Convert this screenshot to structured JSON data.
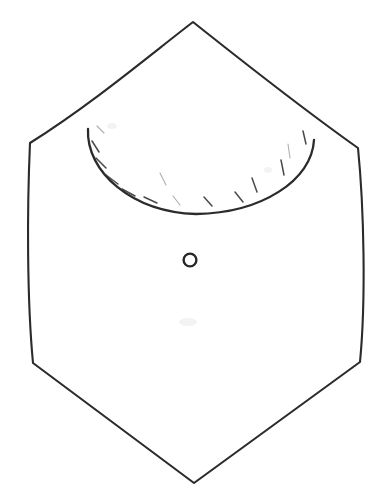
{
  "document": {
    "title": "Hand-drawn sewing pattern piece",
    "subject": "garment yoke / bib panel",
    "medium": "ink line drawing on white paper",
    "width_px": 378,
    "height_px": 502
  },
  "colors": {
    "background": "#ffffff",
    "ink": "#2b2b2b",
    "ink_light": "#6a6a6a",
    "mark": "#262626"
  },
  "shapes": {
    "outline": {
      "name": "hexagonal-panel-outline",
      "description": "six-sided panel: pointed top apex, two side vertices, two lower side vertices, pointed bottom apex",
      "closed": true,
      "stroke_width": 2.1,
      "vertices": [
        {
          "name": "top-apex",
          "x": 193,
          "y": 22
        },
        {
          "name": "right-shoulder",
          "x": 358,
          "y": 148
        },
        {
          "name": "right-hip",
          "x": 360,
          "y": 362
        },
        {
          "name": "bottom-apex",
          "x": 194,
          "y": 483
        },
        {
          "name": "left-hip",
          "x": 33,
          "y": 363
        },
        {
          "name": "left-shoulder",
          "x": 30,
          "y": 143
        }
      ],
      "edges": [
        {
          "name": "top-left-edge",
          "from": "top-apex",
          "to": "left-shoulder",
          "type": "curve",
          "curvature": "concave-outward"
        },
        {
          "name": "top-right-edge",
          "from": "top-apex",
          "to": "right-shoulder",
          "type": "curve",
          "curvature": "concave-outward"
        },
        {
          "name": "right-side-edge",
          "from": "right-shoulder",
          "to": "right-hip",
          "type": "near-straight"
        },
        {
          "name": "bottom-right-edge",
          "from": "right-hip",
          "to": "bottom-apex",
          "type": "straight"
        },
        {
          "name": "bottom-left-edge",
          "from": "left-hip",
          "to": "bottom-apex",
          "type": "straight"
        },
        {
          "name": "left-side-edge",
          "from": "left-shoulder",
          "to": "left-hip",
          "type": "near-straight"
        }
      ],
      "path": "M 193 22 C 150 55 92 104 30 143 C 27 210 27 300 33 363 L 194 483 L 360 362 C 366 300 364 208 358 148 C 300 107 237 57 193 22 Z"
    },
    "neckline": {
      "name": "neckline-arc",
      "description": "wide U-shaped scooped neckline arc spanning between the two shoulder regions",
      "stroke_width": 2.3,
      "start": {
        "x": 88,
        "y": 129
      },
      "end": {
        "x": 314,
        "y": 140
      },
      "lowest_point": {
        "x": 196,
        "y": 214
      },
      "path": "M 88 129 C 86 172 132 212 196 214 C 262 213 312 180 314 140"
    },
    "placement_mark": {
      "name": "button-placement-circle",
      "description": "small open circle marking button / snap placement below the neckline",
      "center": {
        "x": 190,
        "y": 260
      },
      "radius": 6.4,
      "stroke_width": 2.4
    }
  },
  "hatch_marks": {
    "name": "neckline-hatch-marks",
    "description": "short radial tick strokes drawn just inside the neckline arc, indicating seam allowance / gathering",
    "count": 14,
    "strokes": [
      {
        "x1": 97,
        "y1": 126,
        "x2": 104,
        "y2": 133,
        "weight": "faint"
      },
      {
        "x1": 92,
        "y1": 141,
        "x2": 99,
        "y2": 152,
        "weight": "normal"
      },
      {
        "x1": 96,
        "y1": 158,
        "x2": 106,
        "y2": 168,
        "weight": "normal"
      },
      {
        "x1": 106,
        "y1": 175,
        "x2": 118,
        "y2": 184,
        "weight": "normal"
      },
      {
        "x1": 122,
        "y1": 189,
        "x2": 135,
        "y2": 196,
        "weight": "normal"
      },
      {
        "x1": 144,
        "y1": 197,
        "x2": 157,
        "y2": 203,
        "weight": "normal"
      },
      {
        "x1": 160,
        "y1": 173,
        "x2": 166,
        "y2": 185,
        "weight": "faint"
      },
      {
        "x1": 173,
        "y1": 196,
        "x2": 180,
        "y2": 205,
        "weight": "faint"
      },
      {
        "x1": 204,
        "y1": 197,
        "x2": 212,
        "y2": 206,
        "weight": "normal"
      },
      {
        "x1": 235,
        "y1": 192,
        "x2": 243,
        "y2": 202,
        "weight": "normal"
      },
      {
        "x1": 252,
        "y1": 178,
        "x2": 257,
        "y2": 192,
        "weight": "normal"
      },
      {
        "x1": 281,
        "y1": 160,
        "x2": 284,
        "y2": 175,
        "weight": "normal"
      },
      {
        "x1": 288,
        "y1": 144,
        "x2": 290,
        "y2": 158,
        "weight": "faint"
      },
      {
        "x1": 303,
        "y1": 131,
        "x2": 306,
        "y2": 144,
        "weight": "normal"
      }
    ]
  },
  "smudges": [
    {
      "name": "paper-smudge-center",
      "x": 188,
      "y": 322,
      "rx": 9,
      "ry": 4
    },
    {
      "name": "paper-smudge-neck",
      "x": 112,
      "y": 126,
      "rx": 5,
      "ry": 3
    },
    {
      "name": "paper-smudge-right",
      "x": 268,
      "y": 170,
      "rx": 4,
      "ry": 3
    }
  ]
}
